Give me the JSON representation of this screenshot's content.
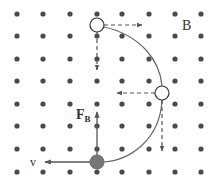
{
  "diagram": {
    "field_label": "B",
    "force_label_main": "F",
    "force_label_sub": "B",
    "velocity_label": "v",
    "colors": {
      "dot": "#4a4a4a",
      "path": "#666666",
      "arrow": "#555555",
      "particle_fill": "#777777",
      "text": "#333333"
    },
    "grid": {
      "xs": [
        17,
        43,
        70,
        97,
        122,
        149,
        175,
        201
      ],
      "ys": [
        14,
        36,
        59,
        81,
        104,
        126,
        149,
        172
      ]
    },
    "particles": [
      {
        "name": "top",
        "x": 97,
        "y": 25,
        "filled": false
      },
      {
        "name": "right",
        "x": 162,
        "y": 93,
        "filled": false
      },
      {
        "name": "bottom",
        "x": 97,
        "y": 162,
        "filled": true
      }
    ]
  }
}
